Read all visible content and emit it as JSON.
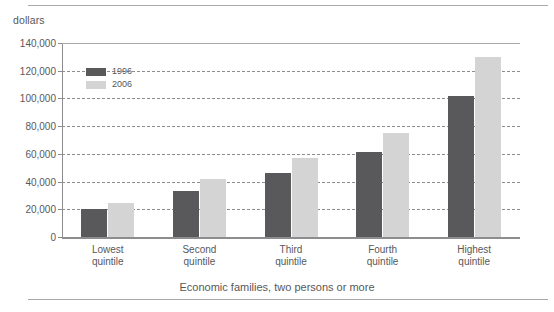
{
  "chart_data": {
    "type": "bar",
    "title": "",
    "subtitle": "",
    "xlabel": "Economic families, two persons or more",
    "ylabel": "dollars",
    "ylim": [
      0,
      140000
    ],
    "ytick_labels": [
      "140,000",
      "120,000",
      "100,000",
      "80,000",
      "60,000",
      "40,000",
      "20,000",
      "0"
    ],
    "ytick_values": [
      140000,
      120000,
      100000,
      80000,
      60000,
      40000,
      20000,
      0
    ],
    "grid": "horizontal-dashed",
    "legend_position": "upper-left-inside",
    "categories": [
      "Lowest quintile",
      "Second quintile",
      "Third quintile",
      "Fourth quintile",
      "Highest quintile"
    ],
    "category_lines": [
      [
        "Lowest",
        "quintile"
      ],
      [
        "Second",
        "quintile"
      ],
      [
        "Third",
        "quintile"
      ],
      [
        "Fourth",
        "quintile"
      ],
      [
        "Highest",
        "quintile"
      ]
    ],
    "series": [
      {
        "name": "1996",
        "color": "#59595b",
        "values": [
          20000,
          33000,
          46000,
          61000,
          102000
        ]
      },
      {
        "name": "2006",
        "color": "#d4d4d4",
        "values": [
          24500,
          42000,
          57000,
          75000,
          130000
        ]
      }
    ]
  },
  "axis": {
    "unit_label": "dollars"
  },
  "caption": {
    "text": "Economic families, two persons or more"
  },
  "legend": {
    "items": [
      {
        "label": "1996"
      },
      {
        "label": "2006"
      }
    ]
  },
  "colors": {
    "series_1996": "#59595b",
    "series_2006": "#d4d4d4",
    "axis": "#8d8d8f",
    "text": "#58585a",
    "rule": "#a9a9ab",
    "background": "#ffffff"
  }
}
